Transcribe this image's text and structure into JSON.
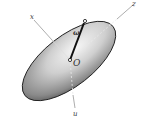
{
  "diagram": {
    "title": "",
    "labels": {
      "x_axis": "x",
      "z_axis": "z",
      "u_axis": "u",
      "origin": "O",
      "angular_velocity": "ω"
    },
    "colors": {
      "body_light": "#f2f2f2",
      "body_dark": "#6e6e6e",
      "outline": "#222222",
      "axis": "#888888",
      "vector": "#111111"
    }
  }
}
